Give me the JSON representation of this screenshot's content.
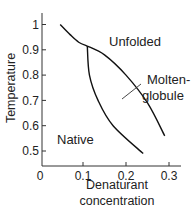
{
  "chart_data": {
    "type": "line",
    "title": "",
    "xlabel_lines": [
      "Denaturant",
      "concentration"
    ],
    "ylabel": "Temperature",
    "xlim": [
      0,
      0.3
    ],
    "ylim": [
      0.5,
      1.0
    ],
    "x_ticks": [
      0,
      0.1,
      0.2,
      0.3
    ],
    "x_tick_labels": [
      "0",
      "0.1",
      "0.2",
      "0.3"
    ],
    "y_ticks": [
      0.5,
      0.6,
      0.7,
      0.8,
      0.9,
      1.0
    ],
    "y_tick_labels": [
      "0.5",
      "0.6",
      "0.7",
      "0.8",
      "0.9",
      "1"
    ],
    "grid": false,
    "series": [
      {
        "name": "native-unfolded boundary",
        "points": [
          [
            0.047,
            1.0
          ],
          [
            0.07,
            0.96
          ],
          [
            0.09,
            0.93
          ],
          [
            0.11,
            0.915
          ]
        ]
      },
      {
        "name": "molten-globule-unfolded boundary",
        "points": [
          [
            0.11,
            0.915
          ],
          [
            0.15,
            0.88
          ],
          [
            0.2,
            0.8
          ],
          [
            0.25,
            0.69
          ],
          [
            0.29,
            0.56
          ]
        ]
      },
      {
        "name": "native-molten-globule boundary",
        "points": [
          [
            0.11,
            0.915
          ],
          [
            0.115,
            0.8
          ],
          [
            0.135,
            0.7
          ],
          [
            0.17,
            0.6
          ],
          [
            0.24,
            0.49
          ]
        ]
      }
    ],
    "annotations": [
      {
        "text": "Unfolded",
        "x": 0.22,
        "y": 0.95
      },
      {
        "text": "Molten-",
        "x": 0.26,
        "y": 0.78
      },
      {
        "text": "globule",
        "x": 0.26,
        "y": 0.725
      },
      {
        "text": "Native",
        "x": 0.07,
        "y": 0.57
      }
    ]
  }
}
